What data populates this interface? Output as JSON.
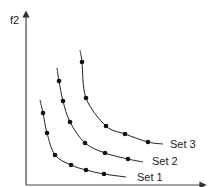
{
  "chart_data": {
    "type": "line",
    "title": "",
    "xlabel": "",
    "ylabel": "f2",
    "grid": false,
    "legend_position": "inline-right",
    "series": [
      {
        "name": "Set 1",
        "curve_px": [
          [
            40,
            100
          ],
          [
            43,
            113
          ],
          [
            47,
            133
          ],
          [
            55,
            155
          ],
          [
            71,
            165
          ],
          [
            86,
            170
          ],
          [
            104,
            174
          ],
          [
            126,
            177
          ]
        ],
        "points_px": [
          [
            43,
            113
          ],
          [
            47,
            133
          ],
          [
            55,
            155
          ],
          [
            71,
            165
          ],
          [
            86,
            170
          ],
          [
            104,
            174
          ]
        ],
        "label_px": [
          137,
          181
        ]
      },
      {
        "name": "Set 2",
        "curve_px": [
          [
            57,
            68
          ],
          [
            59,
            81
          ],
          [
            63,
            101
          ],
          [
            70,
            122
          ],
          [
            85,
            143
          ],
          [
            105,
            153
          ],
          [
            128,
            159
          ],
          [
            143,
            162
          ]
        ],
        "points_px": [
          [
            59,
            81
          ],
          [
            63,
            101
          ],
          [
            70,
            122
          ],
          [
            85,
            143
          ],
          [
            105,
            153
          ],
          [
            128,
            159
          ]
        ],
        "label_px": [
          152,
          165
        ]
      },
      {
        "name": "Set 3",
        "curve_px": [
          [
            80,
            50
          ],
          [
            82,
            62
          ],
          [
            86,
            98
          ],
          [
            106,
            126
          ],
          [
            125,
            134
          ],
          [
            148,
            142
          ],
          [
            163,
            144
          ]
        ],
        "points_px": [
          [
            82,
            62
          ],
          [
            86,
            98
          ],
          [
            106,
            126
          ],
          [
            125,
            134
          ],
          [
            148,
            142
          ]
        ],
        "label_px": [
          170,
          148
        ]
      }
    ]
  },
  "axes": {
    "y_label": "f2",
    "x_label": ""
  },
  "colors": {
    "line": "#222222",
    "point": "#111111"
  }
}
